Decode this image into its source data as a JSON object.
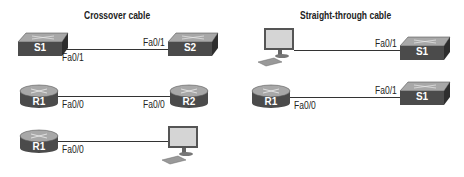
{
  "panels": [
    {
      "title": "Crossover cable",
      "connections": [
        {
          "from": {
            "type": "switch",
            "label": "S1"
          },
          "from_port": "Fa0/1",
          "to": {
            "type": "switch",
            "label": "S2"
          },
          "to_port": "Fa0/1"
        },
        {
          "from": {
            "type": "router",
            "label": "R1"
          },
          "from_port": "Fa0/0",
          "to": {
            "type": "router",
            "label": "R2"
          },
          "to_port": "Fa0/0"
        },
        {
          "from": {
            "type": "router",
            "label": "R1"
          },
          "from_port": "Fa0/0",
          "to": {
            "type": "pc",
            "label": ""
          },
          "to_port": ""
        }
      ]
    },
    {
      "title": "Straight-through cable",
      "connections": [
        {
          "from": {
            "type": "pc",
            "label": ""
          },
          "from_port": "",
          "to": {
            "type": "switch",
            "label": "S1"
          },
          "to_port": "Fa0/1"
        },
        {
          "from": {
            "type": "router",
            "label": "R1"
          },
          "from_port": "Fa0/0",
          "to": {
            "type": "switch",
            "label": "S1"
          },
          "to_port": "Fa0/1"
        }
      ]
    }
  ],
  "colors": {
    "device_dark": "#4a4a4a",
    "device_top": "#9a9a9a",
    "cable": "#333333"
  }
}
